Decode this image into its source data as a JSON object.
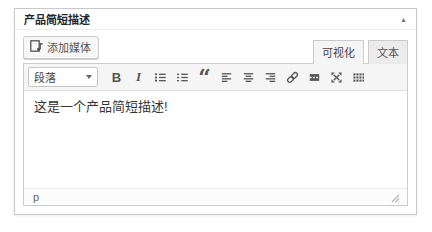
{
  "panel": {
    "title": "产品简短描述",
    "collapse_icon": "▲"
  },
  "media_row": {
    "add_media_label": "添加媒体"
  },
  "tabs": {
    "visual_label": "可视化",
    "text_label": "文本",
    "active": "visual"
  },
  "toolbar": {
    "format_select_value": "段落",
    "buttons": [
      {
        "name": "bold-button",
        "glyph": "B"
      },
      {
        "name": "italic-button",
        "glyph": "I"
      },
      {
        "name": "bullet-list-button",
        "icon": "bullet-list-icon"
      },
      {
        "name": "numbered-list-button",
        "icon": "numbered-list-icon"
      },
      {
        "name": "blockquote-button",
        "glyph": "“"
      },
      {
        "name": "align-left-button",
        "icon": "align-left-icon"
      },
      {
        "name": "align-center-button",
        "icon": "align-center-icon"
      },
      {
        "name": "align-right-button",
        "icon": "align-right-icon"
      },
      {
        "name": "link-button",
        "icon": "link-icon"
      },
      {
        "name": "more-tag-button",
        "icon": "more-tag-icon"
      },
      {
        "name": "fullscreen-button",
        "icon": "fullscreen-icon"
      },
      {
        "name": "toolbar-toggle-button",
        "icon": "toolbar-toggle-icon"
      }
    ]
  },
  "editor": {
    "content": "这是一个产品简短描述!"
  },
  "statusbar": {
    "path": "p"
  },
  "colors": {
    "panel_border": "#c9c9c9",
    "toolbar_bg": "#f5f5f5",
    "tab_inactive_bg": "#ebebeb",
    "icon_color": "#555555",
    "text_color": "#333333"
  }
}
